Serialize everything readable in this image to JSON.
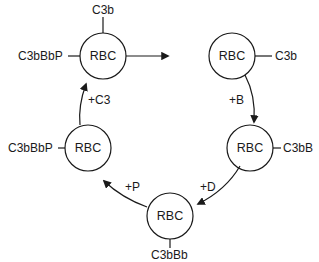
{
  "diagram": {
    "cells": [
      {
        "id": "c1",
        "label": "RBC",
        "cx": 103,
        "cy": 56
      },
      {
        "id": "c2",
        "label": "RBC",
        "cx": 232,
        "cy": 56
      },
      {
        "id": "c3",
        "label": "RBC",
        "cx": 250,
        "cy": 148
      },
      {
        "id": "c4",
        "label": "RBC",
        "cx": 170,
        "cy": 216
      },
      {
        "id": "c5",
        "label": "RBC",
        "cx": 88,
        "cy": 148
      }
    ],
    "attachments": {
      "c1_top": "C3b",
      "c1_left": "C3bBbP",
      "c2_right": "C3b",
      "c3_right": "C3bB",
      "c4_bottom": "C3bBb",
      "c5_left": "C3bBbP"
    },
    "steps": {
      "add_b": "+B",
      "add_d": "+D",
      "add_p": "+P",
      "add_c3": "+C3"
    },
    "line_color": "#1a1a1a"
  }
}
